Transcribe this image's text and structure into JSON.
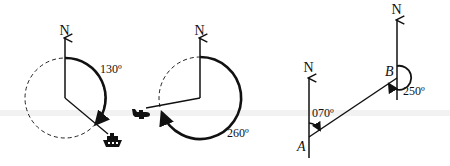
{
  "figure": {
    "diagrams": [
      {
        "id": "ship-bearing",
        "north_label": "N",
        "angle_label": "130º",
        "bearing_degrees": 130,
        "object": "ship-icon"
      },
      {
        "id": "plane-bearing",
        "north_label": "N",
        "angle_label": "260º",
        "bearing_degrees": 260,
        "object": "plane-icon"
      },
      {
        "id": "a-to-b-bearing",
        "point_a_label": "A",
        "point_b_label": "B",
        "north_label_a": "N",
        "north_label_b": "N",
        "angle_a_label": "070º",
        "angle_b_label": "250º",
        "bearing_a_to_b": 70,
        "bearing_b_to_a": 250
      }
    ]
  },
  "colors": {
    "ink": "#111111",
    "background": "#ffffff"
  }
}
